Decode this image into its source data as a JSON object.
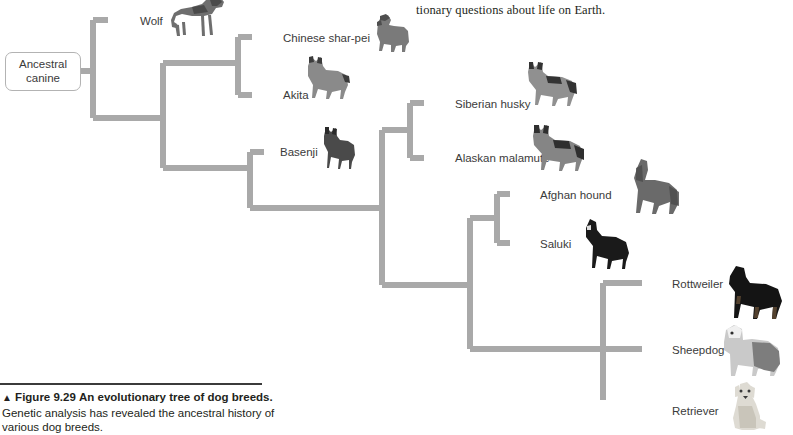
{
  "page": {
    "body_text_fragment": "tionary questions about life on Earth."
  },
  "figure": {
    "root_label": "Ancestral canine",
    "caption_marker": "▲",
    "caption_number": "Figure 9.29",
    "caption_title": "An evolutionary tree of dog breeds.",
    "caption_body": "Genetic analysis has revealed the ancestral history of various dog breeds.",
    "branch_color": "#a9a9a9",
    "label_color": "#3b3b3b",
    "taxa": [
      {
        "id": "wolf",
        "label": "Wolf",
        "x": 140,
        "y": 15,
        "tip_x": 108,
        "tip_y": 20
      },
      {
        "id": "chinese-shar-pei",
        "label": "Chinese shar-pei",
        "x": 283,
        "y": 32,
        "tip_x": 252,
        "tip_y": 37
      },
      {
        "id": "akita",
        "label": "Akita",
        "x": 283,
        "y": 89,
        "tip_x": 252,
        "tip_y": 95
      },
      {
        "id": "basenji",
        "label": "Basenji",
        "x": 280,
        "y": 146,
        "tip_x": 250,
        "tip_y": 152
      },
      {
        "id": "siberian-husky",
        "label": "Siberian husky",
        "x": 455,
        "y": 98,
        "tip_x": 424,
        "tip_y": 103
      },
      {
        "id": "alaskan-malamute",
        "label": "Alaskan malamute",
        "x": 455,
        "y": 152,
        "tip_x": 424,
        "tip_y": 158
      },
      {
        "id": "afghan-hound",
        "label": "Afghan hound",
        "x": 540,
        "y": 189,
        "tip_x": 510,
        "tip_y": 194
      },
      {
        "id": "saluki",
        "label": "Saluki",
        "x": 540,
        "y": 238,
        "tip_x": 510,
        "tip_y": 243
      },
      {
        "id": "rottweiler",
        "label": "Rottweiler",
        "x": 672,
        "y": 278,
        "tip_x": 642,
        "tip_y": 283
      },
      {
        "id": "sheepdog",
        "label": "Sheepdog",
        "x": 672,
        "y": 344,
        "tip_x": 642,
        "tip_y": 349
      },
      {
        "id": "retriever",
        "label": "Retriever",
        "x": 672,
        "y": 405,
        "tip_x": 642,
        "tip_y": 410
      }
    ],
    "nodes": [
      {
        "id": "root-split",
        "x": 93,
        "y_top": 20,
        "y_bottom": 118,
        "in_y": 71
      },
      {
        "id": "node-b",
        "x": 163,
        "y_top": 63,
        "y_bottom": 168,
        "in_y": 118
      },
      {
        "id": "node-sharpei-akita",
        "x": 238,
        "y_top": 37,
        "y_bottom": 95,
        "in_y": 63
      },
      {
        "id": "node-c",
        "x": 382,
        "y_top": 130,
        "y_bottom": 285,
        "in_y": 208
      },
      {
        "id": "node-husky",
        "x": 410,
        "y_top": 103,
        "y_bottom": 158,
        "in_y": 130
      },
      {
        "id": "node-d",
        "x": 470,
        "y_top": 218,
        "y_bottom": 349,
        "in_y": 285
      },
      {
        "id": "node-afghan",
        "x": 497,
        "y_top": 194,
        "y_bottom": 243,
        "in_y": 218
      },
      {
        "id": "node-working",
        "x": 603,
        "y_top": 283,
        "y_bottom": 410,
        "in_y": 349
      }
    ]
  }
}
